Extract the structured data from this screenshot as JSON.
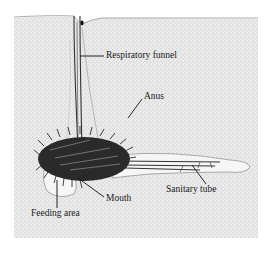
{
  "figure": {
    "labels": {
      "respiratory_funnel": "Respiratory funnel",
      "anus": "Anus",
      "sanitary_tube": "Sanitary tube",
      "mouth": "Mouth",
      "feeding_area": "Feeding area"
    },
    "colors": {
      "sediment": "#e6e6e6",
      "stipple": "#9a9a9a",
      "ink": "#1a1a1a",
      "tube_fill": "#f4f4f4"
    }
  }
}
